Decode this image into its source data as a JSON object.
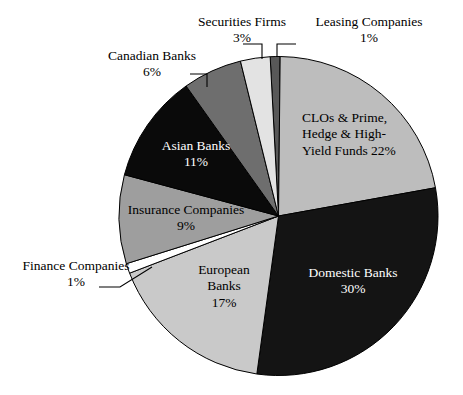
{
  "chart_data": {
    "type": "pie",
    "title": "",
    "subtitle": "",
    "xlabel": "",
    "ylabel": "",
    "legend_position": "none",
    "grid": false,
    "unit": "%",
    "start_angle_deg": 357,
    "direction": "clockwise",
    "categories": [
      "Leasing Companies",
      "CLOs & Prime, Hedge & High-Yield Funds",
      "Domestic Banks",
      "European Banks",
      "Finance Companies",
      "Insurance Companies",
      "Asian Banks",
      "Canadian Banks",
      "Securities Firms"
    ],
    "values": [
      1,
      22,
      30,
      17,
      1,
      9,
      11,
      6,
      3
    ],
    "slices": [
      {
        "name": "Leasing Companies",
        "value": 1,
        "value_text": "1%",
        "label_text": "Leasing Companies",
        "color": "#585858",
        "text_color": "#000000",
        "label_style": "callout"
      },
      {
        "name": "CLOs & Prime, Hedge & High-Yield Funds",
        "value": 22,
        "value_text": "22%",
        "label_line1": "CLOs & Prime,",
        "label_line2": "Hedge & High-",
        "label_line3": "Yield Funds 22%",
        "color": "#bdbdbd",
        "text_color": "#000000",
        "label_style": "inside"
      },
      {
        "name": "Domestic Banks",
        "value": 30,
        "value_text": "30%",
        "label_line1": "Domestic Banks",
        "label_line2": "30%",
        "color": "#141414",
        "text_color": "#ffffff",
        "label_style": "inside"
      },
      {
        "name": "European Banks",
        "value": 17,
        "value_text": "17%",
        "label_line1": "European",
        "label_line2": "Banks",
        "label_line3": "17%",
        "color": "#c9c9c9",
        "text_color": "#000000",
        "label_style": "inside"
      },
      {
        "name": "Finance Companies",
        "value": 1,
        "value_text": "1%",
        "label_text": "Finance Companies",
        "color": "#ffffff",
        "text_color": "#000000",
        "label_style": "callout"
      },
      {
        "name": "Insurance Companies",
        "value": 9,
        "value_text": "9%",
        "label_line1": "Insurance Companies",
        "label_line2": "9%",
        "color": "#9e9e9e",
        "text_color": "#000000",
        "label_style": "inside"
      },
      {
        "name": "Asian Banks",
        "value": 11,
        "value_text": "11%",
        "label_line1": "Asian Banks",
        "label_line2": "11%",
        "color": "#0a0a0a",
        "text_color": "#ffffff",
        "label_style": "inside"
      },
      {
        "name": "Canadian Banks",
        "value": 6,
        "value_text": "6%",
        "label_text": "Canadian Banks",
        "color": "#6e6e6e",
        "text_color": "#000000",
        "label_style": "callout"
      },
      {
        "name": "Securities Firms",
        "value": 3,
        "value_text": "3%",
        "label_text": "Securities Firms",
        "color": "#e3e3e3",
        "text_color": "#000000",
        "label_style": "callout"
      }
    ]
  },
  "callouts": {
    "securities": {
      "label": "Securities Firms",
      "value": "3%"
    },
    "leasing": {
      "label": "Leasing Companies",
      "value": "1%"
    },
    "canadian": {
      "label": "Canadian Banks",
      "value": "6%"
    },
    "finance": {
      "label": "Finance Companies",
      "value": "1%"
    }
  },
  "inside_labels": {
    "clos": {
      "line1": "CLOs & Prime,",
      "line2": "Hedge & High-",
      "line3": "Yield Funds 22%"
    },
    "domestic": {
      "line1": "Domestic Banks",
      "line2": "30%"
    },
    "european": {
      "line1": "European",
      "line2": "Banks",
      "line3": "17%"
    },
    "insurance": {
      "line1": "Insurance Companies",
      "line2": "9%"
    },
    "asian": {
      "line1": "Asian Banks",
      "line2": "11%"
    }
  }
}
